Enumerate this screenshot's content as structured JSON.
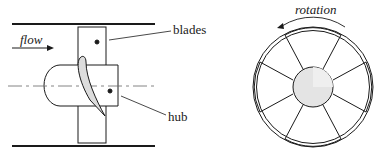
{
  "diagram": {
    "side_view": {
      "flow_label": "flow",
      "blades_label": "blades",
      "hub_label": "hub"
    },
    "front_view": {
      "rotation_label": "rotation",
      "blade_count": 6
    },
    "colors": {
      "stroke": "#1a1a1a",
      "hub_fill": "#e4e4e4",
      "blade_profile_fill": "#dcdcdc"
    }
  }
}
